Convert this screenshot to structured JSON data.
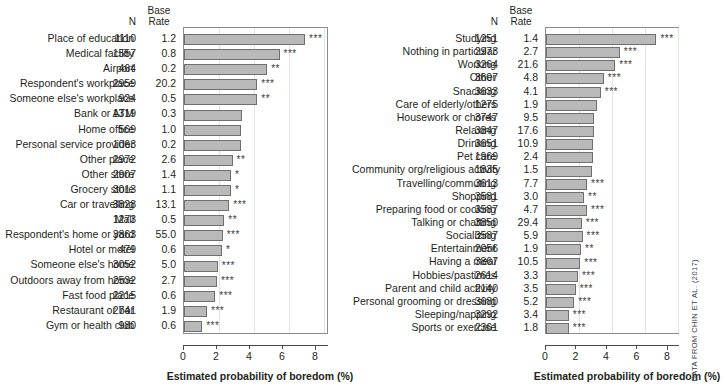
{
  "figure": {
    "credit": "DATA FROM CHIN ET AL. (2017)",
    "column_headers": {
      "n": "N",
      "base_rate_line1": "Base",
      "base_rate_line2": "Rate"
    },
    "axis_title": "Estimated probability of boredom (%)",
    "tick_labels": [
      "0",
      "2",
      "4",
      "6",
      "8"
    ],
    "bar_fill": "#b9b9b9",
    "bar_stroke": "#6f6f6f"
  },
  "chart_data": [
    {
      "type": "bar",
      "title": "",
      "panel": "left",
      "xlabel": "Estimated probability of boredom (%)",
      "ylabel": "",
      "xlim": [
        0,
        8.8
      ],
      "ticks": [
        0,
        2,
        4,
        6,
        8
      ],
      "grid": true,
      "orientation": "horizontal",
      "categories": [
        "Place of education",
        "Medical facility",
        "Airport",
        "Respondent's workplace",
        "Someone else's workplace",
        "Bank or ATM",
        "Home office",
        "Personal service provider",
        "Other place",
        "Other store",
        "Grocery store",
        "Car or travelling",
        "Mall",
        "Respondent's home or yard",
        "Hotel or motel",
        "Someone else's home",
        "Outdoors away from home",
        "Fast food place",
        "Restaurant or bar",
        "Gym or health club"
      ],
      "values": [
        7.35,
        5.8,
        5.05,
        4.45,
        4.45,
        3.5,
        3.45,
        3.45,
        2.95,
        2.85,
        2.85,
        2.75,
        2.45,
        2.35,
        2.3,
        2.05,
        2.0,
        1.9,
        1.4,
        1.1
      ],
      "n": [
        1110,
        1557,
        464,
        2959,
        924,
        1319,
        569,
        1063,
        2972,
        2907,
        3013,
        3828,
        1273,
        3863,
        479,
        3052,
        2532,
        2215,
        2741,
        980
      ],
      "base_rate": [
        "1.2",
        "0.8",
        "0.2",
        "20.2",
        "0.5",
        "0.3",
        "1.0",
        "0.2",
        "2.6",
        "1.4",
        "1.1",
        "13.1",
        "0.5",
        "55.0",
        "0.6",
        "5.0",
        "2.7",
        "0.6",
        "1.9",
        "0.6"
      ],
      "significance": [
        "***",
        "***",
        "**",
        "***",
        "**",
        "",
        "",
        "",
        "**",
        "*",
        "*",
        "***",
        "**",
        "***",
        "*",
        "***",
        "***",
        "***",
        "***",
        "***"
      ]
    },
    {
      "type": "bar",
      "title": "",
      "panel": "right",
      "xlabel": "Estimated probability of boredom (%)",
      "ylabel": "",
      "xlim": [
        0,
        8.8
      ],
      "ticks": [
        0,
        2,
        4,
        6,
        8
      ],
      "grid": true,
      "orientation": "horizontal",
      "categories": [
        "Studying",
        "Nothing in particular",
        "Working",
        "Other",
        "Snacking",
        "Care of elderly/others",
        "Housework or chores",
        "Relaxing",
        "Drinking",
        "Pet care",
        "Community org/religious activity",
        "Travelling/commuting",
        "Shopping",
        "Preparing food or cooking",
        "Talking or chatting",
        "Socializing",
        "Entertainment",
        "Having a meal",
        "Hobbies/pastimes",
        "Parent and child activity",
        "Personal grooming or dressing",
        "Sleeping/napping",
        "Sports or exercise"
      ],
      "values": [
        7.25,
        4.85,
        4.55,
        3.8,
        3.6,
        3.35,
        3.15,
        3.15,
        3.1,
        3.1,
        3.05,
        2.7,
        2.5,
        2.7,
        2.35,
        2.4,
        2.3,
        2.25,
        2.1,
        1.95,
        1.85,
        1.5,
        1.5
      ],
      "n": [
        1251,
        2973,
        3264,
        3607,
        3633,
        1275,
        3747,
        3847,
        3651,
        1969,
        1835,
        3613,
        3581,
        3587,
        3850,
        3587,
        2056,
        3867,
        2614,
        2140,
        3680,
        3292,
        2361
      ],
      "base_rate": [
        "1.4",
        "2.7",
        "21.6",
        "4.8",
        "4.1",
        "1.9",
        "9.5",
        "17.6",
        "10.9",
        "2.4",
        "1.5",
        "7.7",
        "3.0",
        "4.7",
        "29.4",
        "5.9",
        "1.9",
        "10.5",
        "3.3",
        "3.5",
        "5.2",
        "3.4",
        "1.8"
      ],
      "significance": [
        "***",
        "***",
        "***",
        "***",
        "***",
        "",
        "",
        "",
        "",
        "",
        "",
        "***",
        "**",
        "***",
        "***",
        "***",
        "**",
        "***",
        "***",
        "***",
        "***",
        "***",
        "***"
      ]
    }
  ]
}
